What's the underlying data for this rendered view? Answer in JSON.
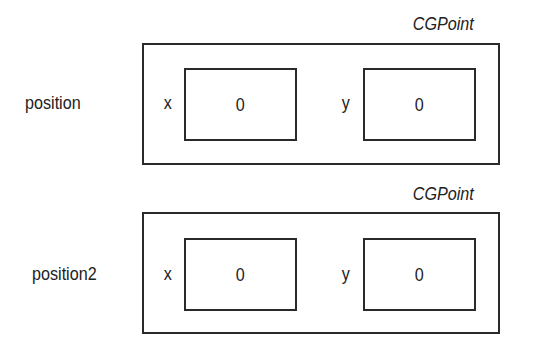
{
  "structs": [
    {
      "variable": "position",
      "type": "CGPoint",
      "fields": [
        {
          "name": "x",
          "value": "0"
        },
        {
          "name": "y",
          "value": "0"
        }
      ]
    },
    {
      "variable": "position2",
      "type": "CGPoint",
      "fields": [
        {
          "name": "x",
          "value": "0"
        },
        {
          "name": "y",
          "value": "0"
        }
      ]
    }
  ]
}
